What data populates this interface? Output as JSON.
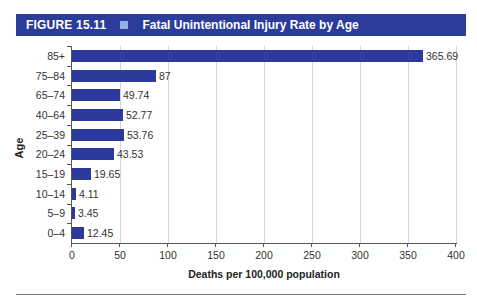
{
  "header": {
    "figure_label": "FIGURE 15.11",
    "title": "Fatal Unintentional Injury Rate by Age",
    "band_color": "#2b3c9b",
    "marker_color": "#8fb4e3"
  },
  "chart_data": {
    "type": "bar",
    "orientation": "horizontal",
    "title": "Fatal Unintentional Injury Rate by Age",
    "xlabel": "Deaths per 100,000 population",
    "ylabel": "Age",
    "xlim": [
      0,
      400
    ],
    "xticks": [
      0,
      50,
      100,
      150,
      200,
      250,
      300,
      350,
      400
    ],
    "grid": "vertical",
    "bar_color": "#2b3a9c",
    "categories": [
      "85+",
      "75–84",
      "65–74",
      "40–64",
      "25–39",
      "20–24",
      "15–19",
      "10–14",
      "5–9",
      "0–4"
    ],
    "values": [
      365.69,
      87,
      49.74,
      52.77,
      53.76,
      43.53,
      19.65,
      4.11,
      3.45,
      12.45
    ],
    "value_labels": [
      "365.69",
      "87",
      "49.74",
      "52.77",
      "53.76",
      "43.53",
      "19.65",
      "4.11",
      "3.45",
      "12.45"
    ]
  }
}
